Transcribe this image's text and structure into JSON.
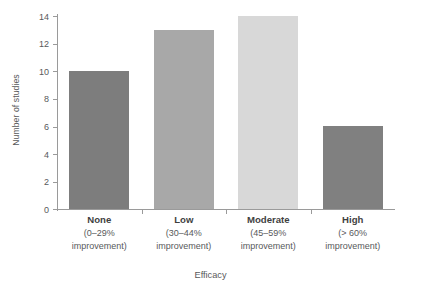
{
  "chart_data": {
    "type": "bar",
    "title": "",
    "subtitle": "",
    "xlabel": "Efficacy",
    "ylabel": "Number of studies",
    "categories": [
      "None",
      "Low",
      "Moderate",
      "High"
    ],
    "category_sublabels": [
      {
        "range": "(0–29%",
        "note": "improvement)"
      },
      {
        "range": "(30–44%",
        "note": "improvement)"
      },
      {
        "range": "(45–59%",
        "note": "improvement)"
      },
      {
        "range": "(> 60%",
        "note": "improvement)"
      }
    ],
    "values": [
      10,
      13,
      14,
      6
    ],
    "bar_colors": [
      "#7d7d7d",
      "#a8a8a8",
      "#d8d8d8",
      "#808080"
    ],
    "ylim": [
      0,
      14
    ],
    "yticks": [
      0,
      2,
      4,
      6,
      8,
      10,
      12,
      14
    ],
    "ytick_labels": [
      "0",
      "2",
      "4",
      "6",
      "8",
      "10",
      "12",
      "14"
    ],
    "grid": false,
    "legend": null,
    "axis_color": "#9a9a9a",
    "text_color": "#58595b"
  }
}
